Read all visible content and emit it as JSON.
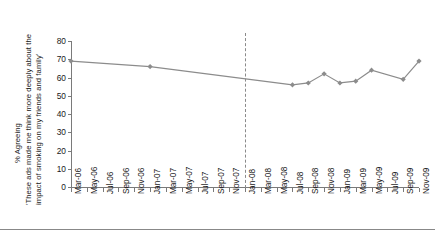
{
  "axis_titles": {
    "percent": "% Agreeing",
    "line1": "'These ads made me think more deeply about the",
    "line2": "impact of smoking on my friends and family'"
  },
  "chart_data": {
    "type": "line",
    "title": "",
    "xlabel": "",
    "ylabel": "% Agreeing",
    "ylim": [
      0,
      80
    ],
    "ytick_step": 10,
    "grid": false,
    "legend": false,
    "line_color": "#8c8c8c",
    "marker_color": "#8c8c8c",
    "divider_color": "#8a8a8a",
    "divider_at": "Jan-08",
    "divider_style": "dashed",
    "categories": [
      "Mar-06",
      "May-06",
      "Jul-06",
      "Sep-06",
      "Nov-06",
      "Jan-07",
      "Mar-07",
      "May-07",
      "Jul-07",
      "Sep-07",
      "Nov-07",
      "Jan-08",
      "Mar-08",
      "May-08",
      "Jul-08",
      "Sep-08",
      "Nov-08",
      "Jan-09",
      "Mar-09",
      "May-09",
      "Jul-09",
      "Sep-09",
      "Nov-09"
    ],
    "yticks": [
      0,
      10,
      20,
      30,
      40,
      50,
      60,
      70,
      80
    ],
    "series": [
      {
        "name": "% Agreeing",
        "points": [
          {
            "x": "Mar-06",
            "y": 69,
            "marker": true
          },
          {
            "x": "Jan-07",
            "y": 66,
            "marker": true
          },
          {
            "x": "Jul-08",
            "y": 56,
            "marker": true
          },
          {
            "x": "Sep-08",
            "y": 57,
            "marker": true
          },
          {
            "x": "Nov-08",
            "y": 62,
            "marker": true
          },
          {
            "x": "Jan-09",
            "y": 57,
            "marker": true
          },
          {
            "x": "Mar-09",
            "y": 58,
            "marker": true
          },
          {
            "x": "May-09",
            "y": 64,
            "marker": true
          },
          {
            "x": "Sep-09",
            "y": 59,
            "marker": true
          },
          {
            "x": "Nov-09",
            "y": 69,
            "marker": true
          }
        ]
      }
    ]
  }
}
